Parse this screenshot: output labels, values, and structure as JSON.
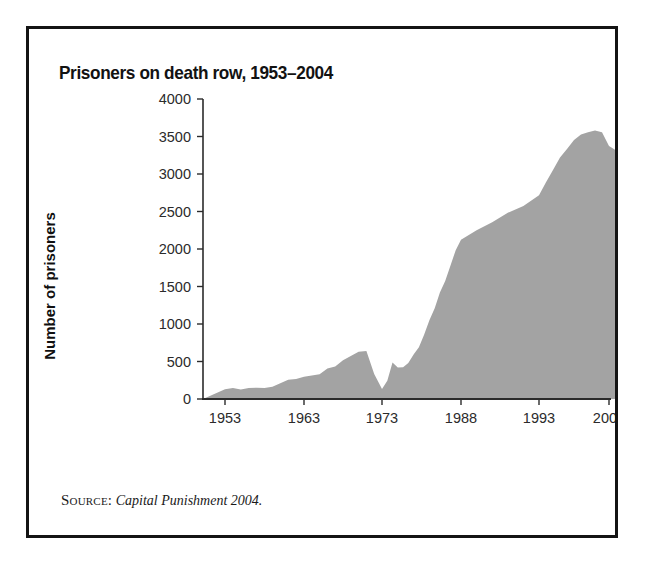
{
  "figure": {
    "title": "Prisoners on death row, 1953–2004",
    "source_label": "Source:",
    "source_text": "Capital Punishment 2004.",
    "frame_color": "#141414",
    "background": "#ffffff"
  },
  "chart_data": {
    "type": "area",
    "title": "Prisoners on death row, 1953–2004",
    "xlabel": "",
    "ylabel": "Number of prisoners",
    "fill_color": "#a3a3a3",
    "axis_color": "#2b2b2b",
    "grid": false,
    "legend": null,
    "xlim": [
      1953,
      2004
    ],
    "ylim": [
      0,
      4000
    ],
    "ytick_labels": [
      "0",
      "500",
      "1000",
      "1500",
      "2000",
      "2500",
      "3000",
      "3500",
      "4000"
    ],
    "yticks": [
      0,
      500,
      1000,
      1500,
      2000,
      2500,
      3000,
      3500,
      4000
    ],
    "xtick_labels": [
      "1953",
      "1963",
      "1973",
      "1988",
      "1993",
      "2003"
    ],
    "xticks": [
      1953,
      1963,
      1973,
      1988,
      1993,
      2003
    ],
    "x": [
      1953,
      1954,
      1955,
      1956,
      1957,
      1958,
      1959,
      1960,
      1961,
      1962,
      1963,
      1964,
      1965,
      1966,
      1967,
      1968,
      1969,
      1970,
      1971,
      1972,
      1973,
      1974,
      1975,
      1976,
      1977,
      1978,
      1979,
      1980,
      1981,
      1982,
      1983,
      1984,
      1985,
      1986,
      1987,
      1988,
      1989,
      1990,
      1991,
      1992,
      1993,
      1994,
      1995,
      1996,
      1997,
      1998,
      1999,
      2000,
      2001,
      2002,
      2003,
      2004
    ],
    "values": [
      131,
      147,
      125,
      146,
      151,
      147,
      164,
      210,
      257,
      267,
      297,
      315,
      331,
      406,
      435,
      517,
      575,
      631,
      642,
      334,
      134,
      244,
      488,
      420,
      423,
      482,
      593,
      691,
      856,
      1050,
      1209,
      1420,
      1575,
      1781,
      1984,
      2124,
      2250,
      2356,
      2482,
      2575,
      2716,
      2890,
      3054,
      3219,
      3335,
      3452,
      3527,
      3557,
      3581,
      3557,
      3374,
      3315
    ],
    "series_name": "Number of prisoners under sentence of death",
    "annotations": []
  },
  "plot_geometry": {
    "pixel_left": 174,
    "pixel_right": 580,
    "pixel_top": 140,
    "pixel_bottom": 440
  }
}
